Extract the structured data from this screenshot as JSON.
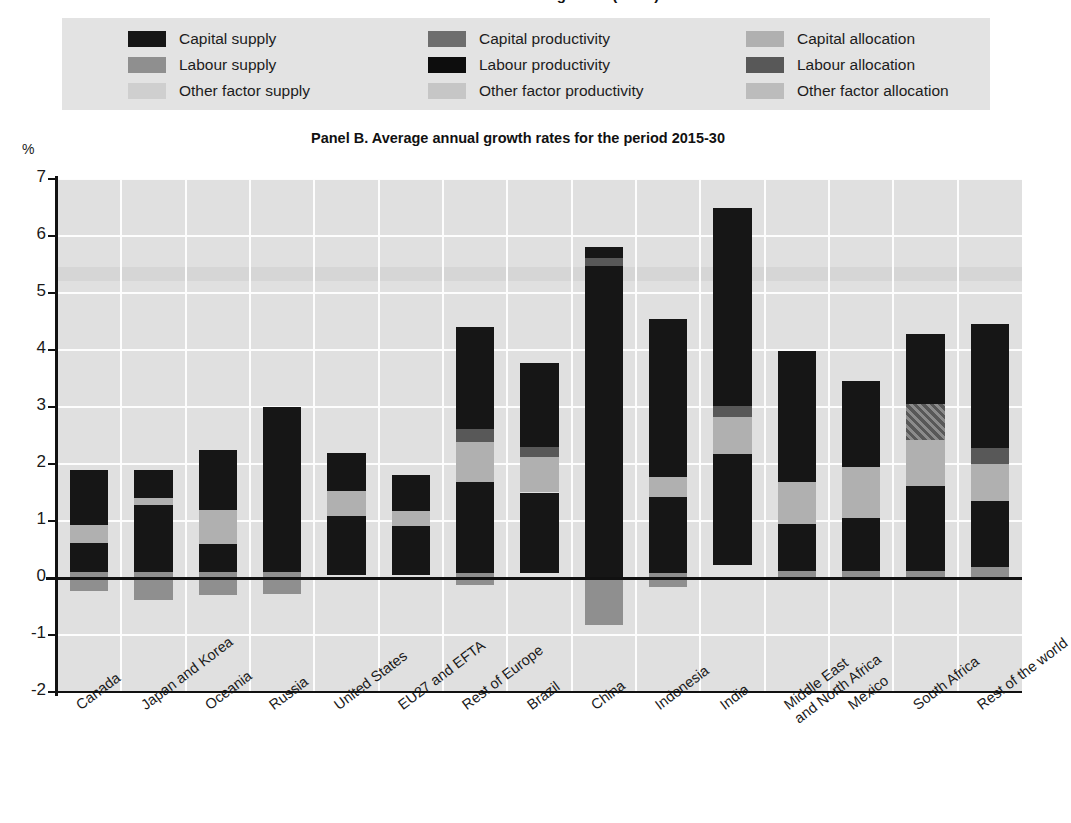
{
  "top_fragment": "Panel A. Contribution to growth (cont.)",
  "legend": {
    "items": [
      {
        "label": "Capital supply",
        "color": "#161616",
        "icon": "legend-swatch"
      },
      {
        "label": "Capital productivity",
        "color": "#6e6e6e",
        "icon": "legend-swatch"
      },
      {
        "label": "Capital allocation",
        "color": "#b0b0b0",
        "icon": "legend-swatch"
      },
      {
        "label": "Labour supply",
        "color": "#8f8f8f",
        "icon": "legend-swatch"
      },
      {
        "label": "Labour productivity",
        "color": "#0d0d0d",
        "icon": "legend-swatch"
      },
      {
        "label": "Labour allocation",
        "color": "#585858",
        "icon": "legend-swatch"
      },
      {
        "label": "Other factor supply",
        "color": "#cfcfcf",
        "icon": "legend-swatch"
      },
      {
        "label": "Other factor productivity",
        "color": "#c6c6c6",
        "icon": "legend-swatch"
      },
      {
        "label": "Other factor allocation",
        "color": "#bcbcbc",
        "icon": "legend-swatch"
      }
    ]
  },
  "axis": {
    "unit_label": "%",
    "y_ticks": [
      "7",
      "6",
      "5",
      "4",
      "3",
      "2",
      "1",
      "0",
      "-1",
      "-2"
    ]
  },
  "chart_data": {
    "type": "bar",
    "stacked": true,
    "title": "Panel B. Average annual growth rates for the period 2015-30",
    "xlabel": "",
    "ylabel": "%",
    "ylim": [
      -2,
      7
    ],
    "ytick_step": 1,
    "grid": true,
    "legend_position": "top",
    "series": [
      {
        "name": "Capital supply",
        "color": "#161616"
      },
      {
        "name": "Capital productivity",
        "color": "#6e6e6e"
      },
      {
        "name": "Capital allocation",
        "color": "#b0b0b0"
      },
      {
        "name": "Labour supply",
        "color": "#8f8f8f"
      },
      {
        "name": "Labour productivity",
        "color": "#0d0d0d"
      },
      {
        "name": "Labour allocation",
        "color": "#585858"
      },
      {
        "name": "Other factor supply",
        "color": "#cfcfcf"
      },
      {
        "name": "Other factor productivity",
        "color": "#c6c6c6"
      },
      {
        "name": "Other factor allocation",
        "color": "#bcbcbc"
      }
    ],
    "categories": [
      "Canada",
      "Japan and Korea",
      "Oceania",
      "Russia",
      "United States",
      "EU27 and EFTA",
      "Rest of Europe",
      "Brazil",
      "China",
      "Indonesia",
      "India",
      "Middle East\nand North Africa",
      "Mexico",
      "South Africa",
      "Rest of the world"
    ],
    "totals": [
      1.9,
      1.9,
      2.25,
      3.0,
      2.2,
      1.8,
      4.4,
      3.78,
      5.8,
      4.55,
      6.5,
      3.98,
      3.45,
      4.28,
      4.45
    ],
    "bars": [
      {
        "category": "Canada",
        "segments": [
          {
            "series": "Labour supply",
            "from": -0.22,
            "to": 0.1,
            "color": "#8f8f8f"
          },
          {
            "series": "Capital supply",
            "from": 0.1,
            "to": 0.62,
            "color": "#161616"
          },
          {
            "series": "Capital allocation",
            "from": 0.62,
            "to": 0.93,
            "color": "#b0b0b0"
          },
          {
            "series": "Labour productivity",
            "from": 0.93,
            "to": 1.9,
            "color": "#161616"
          }
        ]
      },
      {
        "category": "Japan and Korea",
        "segments": [
          {
            "series": "Labour supply",
            "from": -0.38,
            "to": 0.1,
            "color": "#8f8f8f"
          },
          {
            "series": "Capital supply",
            "from": 0.1,
            "to": 1.28,
            "color": "#161616"
          },
          {
            "series": "Capital allocation",
            "from": 1.28,
            "to": 1.4,
            "color": "#b0b0b0"
          },
          {
            "series": "Labour productivity",
            "from": 1.4,
            "to": 1.9,
            "color": "#161616"
          }
        ]
      },
      {
        "category": "Oceania",
        "segments": [
          {
            "series": "Labour supply",
            "from": -0.3,
            "to": 0.1,
            "color": "#8f8f8f"
          },
          {
            "series": "Capital supply",
            "from": 0.1,
            "to": 0.6,
            "color": "#161616"
          },
          {
            "series": "Capital allocation",
            "from": 0.6,
            "to": 1.2,
            "color": "#b0b0b0"
          },
          {
            "series": "Labour productivity",
            "from": 1.2,
            "to": 2.25,
            "color": "#161616"
          }
        ]
      },
      {
        "category": "Russia",
        "segments": [
          {
            "series": "Labour supply",
            "from": -0.28,
            "to": 0.1,
            "color": "#8f8f8f"
          },
          {
            "series": "Capital supply",
            "from": 0.1,
            "to": 1.32,
            "color": "#161616"
          },
          {
            "series": "Labour productivity",
            "from": 1.32,
            "to": 3.0,
            "color": "#161616"
          }
        ]
      },
      {
        "category": "United States",
        "segments": [
          {
            "series": "Capital supply",
            "from": 0.05,
            "to": 1.08,
            "color": "#161616"
          },
          {
            "series": "Capital allocation",
            "from": 1.08,
            "to": 1.52,
            "color": "#b0b0b0"
          },
          {
            "series": "Labour productivity",
            "from": 1.52,
            "to": 2.2,
            "color": "#161616"
          }
        ]
      },
      {
        "category": "EU27 and EFTA",
        "segments": [
          {
            "series": "Capital supply",
            "from": 0.05,
            "to": 0.92,
            "color": "#161616"
          },
          {
            "series": "Capital allocation",
            "from": 0.92,
            "to": 1.18,
            "color": "#b0b0b0"
          },
          {
            "series": "Labour productivity",
            "from": 1.18,
            "to": 1.8,
            "color": "#161616"
          }
        ]
      },
      {
        "category": "Rest of Europe",
        "segments": [
          {
            "series": "Labour supply",
            "from": -0.12,
            "to": 0.08,
            "color": "#8f8f8f"
          },
          {
            "series": "Capital supply",
            "from": 0.08,
            "to": 1.68,
            "color": "#161616"
          },
          {
            "series": "Capital allocation",
            "from": 1.68,
            "to": 2.38,
            "color": "#b0b0b0"
          },
          {
            "series": "Labour allocation",
            "from": 2.38,
            "to": 2.62,
            "color": "#585858"
          },
          {
            "series": "Labour productivity",
            "from": 2.62,
            "to": 4.4,
            "color": "#161616"
          }
        ]
      },
      {
        "category": "Brazil",
        "segments": [
          {
            "series": "Capital supply",
            "from": 0.08,
            "to": 1.5,
            "color": "#161616"
          },
          {
            "series": "Capital allocation",
            "from": 1.5,
            "to": 2.12,
            "color": "#b0b0b0"
          },
          {
            "series": "Labour allocation",
            "from": 2.12,
            "to": 2.3,
            "color": "#585858"
          },
          {
            "series": "Labour productivity",
            "from": 2.3,
            "to": 3.78,
            "color": "#161616"
          }
        ]
      },
      {
        "category": "China",
        "segments": [
          {
            "series": "Labour supply",
            "from": -0.82,
            "to": 0.0,
            "color": "#8f8f8f"
          },
          {
            "series": "Capital supply",
            "from": 0.0,
            "to": 5.48,
            "color": "#161616"
          },
          {
            "series": "Labour allocation",
            "from": 5.48,
            "to": 5.62,
            "color": "#585858"
          },
          {
            "series": "Labour productivity",
            "from": 5.62,
            "to": 5.8,
            "color": "#161616"
          }
        ]
      },
      {
        "category": "Indonesia",
        "segments": [
          {
            "series": "Labour supply",
            "from": -0.15,
            "to": 0.08,
            "color": "#8f8f8f"
          },
          {
            "series": "Capital supply",
            "from": 0.08,
            "to": 1.42,
            "color": "#161616"
          },
          {
            "series": "Capital allocation",
            "from": 1.42,
            "to": 1.78,
            "color": "#b0b0b0"
          },
          {
            "series": "Labour productivity",
            "from": 1.78,
            "to": 4.55,
            "color": "#161616"
          }
        ]
      },
      {
        "category": "India",
        "segments": [
          {
            "series": "Capital supply",
            "from": 0.22,
            "to": 2.18,
            "color": "#161616"
          },
          {
            "series": "Capital allocation",
            "from": 2.18,
            "to": 2.82,
            "color": "#b0b0b0"
          },
          {
            "series": "Labour allocation",
            "from": 2.82,
            "to": 3.02,
            "color": "#585858"
          },
          {
            "series": "Labour productivity",
            "from": 3.02,
            "to": 6.5,
            "color": "#161616"
          }
        ]
      },
      {
        "category": "Middle East\nand North Africa",
        "segments": [
          {
            "series": "Labour supply",
            "from": 0.0,
            "to": 0.12,
            "color": "#8f8f8f"
          },
          {
            "series": "Capital supply",
            "from": 0.12,
            "to": 0.95,
            "color": "#161616"
          },
          {
            "series": "Capital allocation",
            "from": 0.95,
            "to": 1.68,
            "color": "#b0b0b0"
          },
          {
            "series": "Labour productivity",
            "from": 1.68,
            "to": 3.98,
            "color": "#161616"
          }
        ]
      },
      {
        "category": "Mexico",
        "segments": [
          {
            "series": "Labour supply",
            "from": 0.0,
            "to": 0.12,
            "color": "#8f8f8f"
          },
          {
            "series": "Capital supply",
            "from": 0.12,
            "to": 1.05,
            "color": "#161616"
          },
          {
            "series": "Capital allocation",
            "from": 1.05,
            "to": 1.95,
            "color": "#b0b0b0"
          },
          {
            "series": "Labour productivity",
            "from": 1.95,
            "to": 3.45,
            "color": "#161616"
          }
        ]
      },
      {
        "category": "South Africa",
        "segments": [
          {
            "series": "Labour supply",
            "from": 0.0,
            "to": 0.12,
            "color": "#8f8f8f"
          },
          {
            "series": "Capital supply",
            "from": 0.12,
            "to": 1.62,
            "color": "#161616"
          },
          {
            "series": "Capital allocation",
            "from": 1.62,
            "to": 2.42,
            "color": "#b0b0b0"
          },
          {
            "series": "Labour allocation",
            "from": 2.42,
            "to": 3.05,
            "color": "#585858",
            "hatched": true
          },
          {
            "series": "Labour productivity",
            "from": 3.05,
            "to": 4.28,
            "color": "#161616"
          }
        ]
      },
      {
        "category": "Rest of the world",
        "segments": [
          {
            "series": "Labour supply",
            "from": 0.0,
            "to": 0.2,
            "color": "#8f8f8f"
          },
          {
            "series": "Capital supply",
            "from": 0.2,
            "to": 1.35,
            "color": "#161616"
          },
          {
            "series": "Capital allocation",
            "from": 1.35,
            "to": 2.0,
            "color": "#b0b0b0"
          },
          {
            "series": "Labour allocation",
            "from": 2.0,
            "to": 2.28,
            "color": "#585858"
          },
          {
            "series": "Labour productivity",
            "from": 2.28,
            "to": 4.45,
            "color": "#161616"
          }
        ]
      }
    ]
  }
}
